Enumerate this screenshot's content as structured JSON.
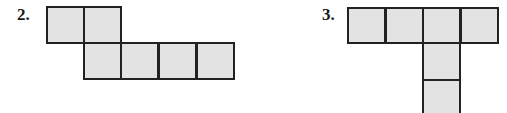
{
  "figures": [
    {
      "label": "2.",
      "fill": "#e3e3e3",
      "stroke": "#222222",
      "squares": [
        [
          46,
          6
        ],
        [
          84,
          6
        ],
        [
          84,
          43
        ],
        [
          122,
          43
        ],
        [
          160,
          43
        ],
        [
          197,
          43
        ]
      ]
    },
    {
      "label": "3.",
      "fill": "#e3e3e3",
      "stroke": "#222222",
      "squares": [
        [
          348,
          7
        ],
        [
          386,
          7
        ],
        [
          423,
          7
        ],
        [
          461,
          7
        ],
        [
          423,
          43
        ],
        [
          423,
          80
        ]
      ]
    }
  ]
}
